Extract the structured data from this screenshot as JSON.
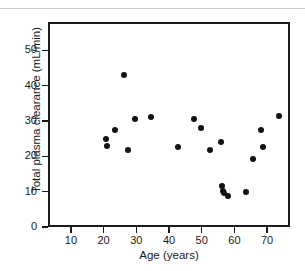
{
  "figure": {
    "top_rule_fragment": "",
    "background": "#ffffff",
    "marker_color": "#111111",
    "axis_color": "#1a1a1a"
  },
  "chart_data": {
    "type": "scatter",
    "title": "",
    "xlabel": "Age (years)",
    "ylabel": "Total plasma clearance (mL/min)",
    "xlim": [
      3,
      77
    ],
    "ylim": [
      0,
      58
    ],
    "xticks": [
      10,
      20,
      30,
      40,
      50,
      60,
      70
    ],
    "xtick_labels": [
      "10",
      "20",
      "30",
      "40",
      "50",
      "60",
      "70"
    ],
    "yticks": [
      0,
      10,
      20,
      30,
      40,
      50
    ],
    "ytick_labels": [
      "0",
      "10",
      "20",
      "30",
      "40",
      "50"
    ],
    "grid": false,
    "legend": null,
    "series": [
      {
        "name": "subjects",
        "marker": "circle",
        "color": "#111111",
        "x": [
          20.0,
          20.3,
          22.8,
          25.5,
          26.8,
          29.0,
          34.0,
          42.0,
          47.0,
          49.3,
          52.0,
          55.3,
          55.5,
          55.8,
          56.3,
          57.3,
          63.0,
          65.0,
          67.5,
          68.0,
          73.0
        ],
        "y": [
          25.5,
          23.5,
          28.0,
          43.5,
          22.3,
          31.0,
          31.7,
          23.2,
          31.0,
          28.5,
          22.3,
          24.5,
          12.3,
          10.7,
          10.3,
          9.4,
          10.6,
          19.9,
          28.0,
          23.2,
          32.0
        ]
      }
    ]
  }
}
